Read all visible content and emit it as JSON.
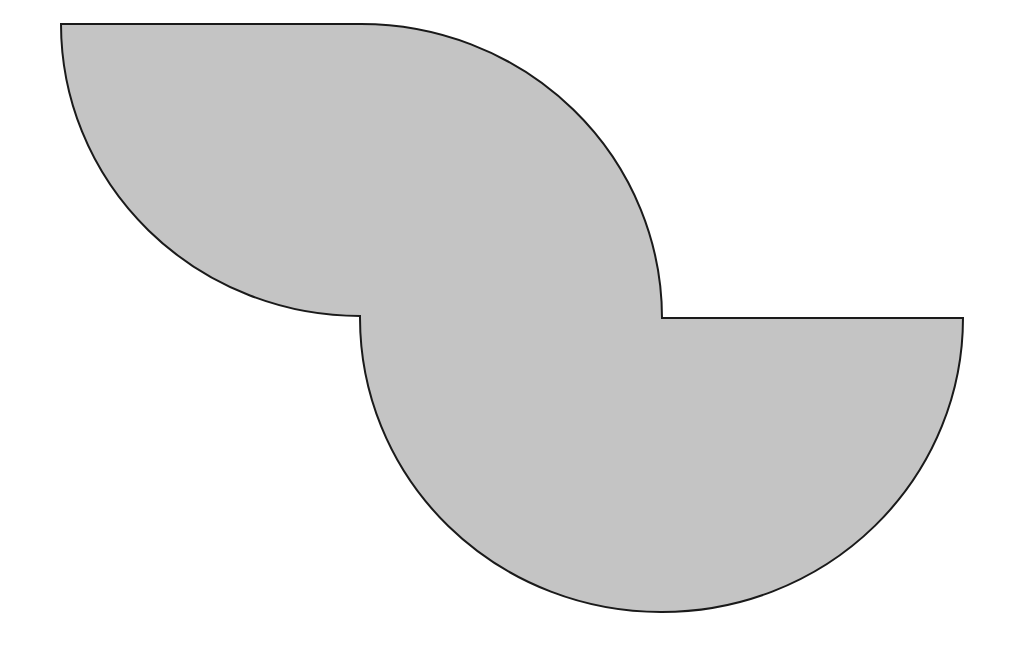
{
  "figure": {
    "fill_color": "#c4c4c4",
    "stroke_color": "#1a1a1a",
    "background": "#ffffff",
    "points": {
      "top_left": [
        61,
        24
      ],
      "top_join": [
        360,
        24
      ],
      "inner_left": [
        360,
        316
      ],
      "inner_right": [
        662,
        318
      ],
      "right_end": [
        963,
        318
      ],
      "bottom": [
        662,
        612
      ]
    },
    "radius": 300
  }
}
